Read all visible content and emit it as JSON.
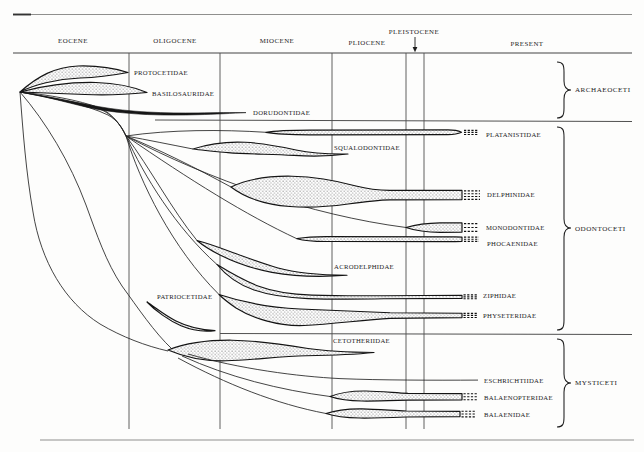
{
  "diagram": {
    "kind": "spindle-range-diagram"
  },
  "epochs": [
    {
      "label": "EOCENE"
    },
    {
      "label": "OLIGOCENE"
    },
    {
      "label": "MIOCENE"
    },
    {
      "label": "PLIOCENE"
    },
    {
      "label": "PLEISTOCENE",
      "pointer": "down-arrow"
    },
    {
      "label": "PRESENT"
    }
  ],
  "groups": [
    {
      "label": "ARCHAEOCETI"
    },
    {
      "label": "ODONTOCETI"
    },
    {
      "label": "MYSTICETI"
    }
  ],
  "families": [
    {
      "label": "PROTOCETIDAE",
      "group": "ARCHAEOCETI",
      "extends_to_present": false
    },
    {
      "label": "BASILOSAURIDAE",
      "group": "ARCHAEOCETI",
      "extends_to_present": false
    },
    {
      "label": "DORUDONTIDAE",
      "group": "ARCHAEOCETI",
      "extends_to_present": false
    },
    {
      "label": "PLATANISTIDAE",
      "group": "ODONTOCETI",
      "extends_to_present": true
    },
    {
      "label": "SQUALODONTIDAE",
      "group": "ODONTOCETI",
      "extends_to_present": false
    },
    {
      "label": "DELPHINIDAE",
      "group": "ODONTOCETI",
      "extends_to_present": true
    },
    {
      "label": "MONODONTIDAE",
      "group": "ODONTOCETI",
      "extends_to_present": true
    },
    {
      "label": "PHOCAENIDAE",
      "group": "ODONTOCETI",
      "extends_to_present": true
    },
    {
      "label": "ACRODELPHIDAE",
      "group": "ODONTOCETI",
      "extends_to_present": false
    },
    {
      "label": "ZIPHIDAE",
      "group": "ODONTOCETI",
      "extends_to_present": true
    },
    {
      "label": "PHYSETERIDAE",
      "group": "ODONTOCETI",
      "extends_to_present": true
    },
    {
      "label": "PATRIOCETIDAE",
      "group": "ODONTOCETI",
      "extends_to_present": false
    },
    {
      "label": "CETOTHERIIDAE",
      "group": "MYSTICETI",
      "extends_to_present": false
    },
    {
      "label": "ESCHRICHTIIDAE",
      "group": "MYSTICETI",
      "extends_to_present": true
    },
    {
      "label": "BALAENOPTERIDAE",
      "group": "MYSTICETI",
      "extends_to_present": true
    },
    {
      "label": "BALAENIDAE",
      "group": "MYSTICETI",
      "extends_to_present": true
    }
  ]
}
